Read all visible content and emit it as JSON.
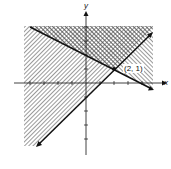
{
  "diagram": {
    "type": "linear-inequality-system",
    "axes": {
      "x_label": "x",
      "y_label": "y"
    },
    "lines": [
      {
        "name": "rising-line",
        "equation": "y = x - 1"
      },
      {
        "name": "falling-line",
        "equation": "y = -x/2 + 2"
      }
    ],
    "intersection": {
      "label": "(2, 1)",
      "x": 2,
      "y": 1
    },
    "colors": {
      "ink": "#111111",
      "hatch": "#444444",
      "background": "#ffffff"
    }
  }
}
